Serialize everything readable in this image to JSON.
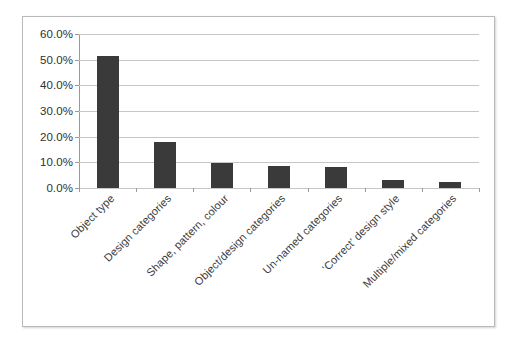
{
  "chart_data": {
    "type": "bar",
    "title": "",
    "subtitle": "",
    "xlabel": "",
    "ylabel": "",
    "ylim": [
      0,
      60
    ],
    "ytick_labels": [
      "60.0%",
      "50.0%",
      "40.0%",
      "30.0%",
      "20.0%",
      "10.0%",
      "0.0%"
    ],
    "ytick_values": [
      60,
      50,
      40,
      30,
      20,
      10,
      0
    ],
    "grid": true,
    "legend": false,
    "legend_position": "none",
    "bar_color": "#3a3a3a",
    "gridline_color": "#c6c6c6",
    "axis_color": "#9a9a9a",
    "categories": [
      "Object type",
      "Design categories",
      "Shape, pattern, colour",
      "Object/design categories",
      "Un-named categories",
      "‘Correct’ design style",
      "Multiple/mixed categories"
    ],
    "values": [
      51.5,
      17.8,
      9.9,
      8.7,
      8.3,
      3.2,
      2.2
    ]
  }
}
